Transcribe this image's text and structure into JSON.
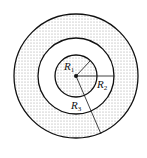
{
  "figure": {
    "center": {
      "x": 76,
      "y": 76
    },
    "circles": [
      {
        "name": "inner",
        "radius": 21,
        "shaded": true
      },
      {
        "name": "middle",
        "radius": 38,
        "shaded": false
      },
      {
        "name": "outer",
        "radius": 62,
        "shaded": true
      }
    ],
    "colors": {
      "stroke": "#111111",
      "stipple": "#9a9a9a",
      "background": "#ffffff"
    }
  },
  "labels": {
    "r1": {
      "letter": "R",
      "sub": "1"
    },
    "r2": {
      "letter": "R",
      "sub": "2"
    },
    "r3": {
      "letter": "R",
      "sub": "3"
    }
  }
}
